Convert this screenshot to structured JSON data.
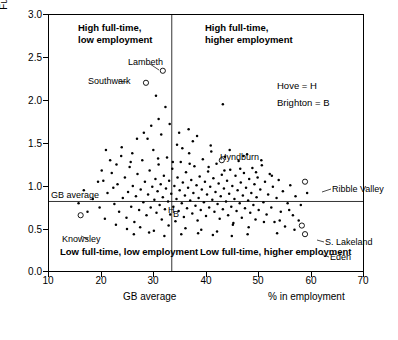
{
  "chart_data": {
    "type": "scatter",
    "title": "",
    "xlabel": "% in employment",
    "ylabel": "Full-time: part-time ratio",
    "xlim": [
      10,
      70
    ],
    "ylim": [
      0.0,
      3.0
    ],
    "xticks": [
      "10",
      "20",
      "30",
      "40",
      "50",
      "60",
      "70"
    ],
    "yticks": [
      "0.0",
      "0.5",
      "1.0",
      "1.5",
      "2.0",
      "2.5",
      "3.0"
    ],
    "grid": false,
    "legend_position": "upper right",
    "reference_lines": [
      {
        "name": "GB average vertical",
        "axis": "x",
        "value": 33.5,
        "label": "GB average"
      },
      {
        "name": "GB average horizontal",
        "axis": "y",
        "value": 0.82,
        "label": "GB average"
      }
    ],
    "quadrant_labels": [
      {
        "text": "High full-time,\nlow employment",
        "x": 21,
        "y": 2.9
      },
      {
        "text": "High full-time,\nhigher employment",
        "x": 40,
        "y": 2.9
      },
      {
        "text": "Low full-time, low employment",
        "x": 16,
        "y": 0.25
      },
      {
        "text": "Low full-time, higher employment",
        "x": 39,
        "y": 0.25
      }
    ],
    "key": [
      "Hove = H",
      "Brighton = B"
    ],
    "annotated_points": [
      {
        "label": "Lambeth",
        "x": 31.8,
        "y": 2.34
      },
      {
        "label": "Southwark",
        "x": 28.6,
        "y": 2.2
      },
      {
        "label": "Hyndburn",
        "x": 43.0,
        "y": 1.3
      },
      {
        "label": "Ribble Valley",
        "x": 58.8,
        "y": 1.05
      },
      {
        "label": "Knowsley",
        "x": 16.2,
        "y": 0.66
      },
      {
        "label": "S. Lakeland",
        "x": 58.2,
        "y": 0.54
      },
      {
        "label": "Eden",
        "x": 58.8,
        "y": 0.44
      },
      {
        "label": "H",
        "x": 33.4,
        "y": 0.72
      },
      {
        "label": "B",
        "x": 34.3,
        "y": 0.68
      }
    ],
    "points": [
      [
        20.5,
        1.06
      ],
      [
        21.3,
        0.92
      ],
      [
        22.1,
        1.15
      ],
      [
        22.6,
        0.79
      ],
      [
        23.2,
        1.02
      ],
      [
        23.5,
        0.7
      ],
      [
        23.9,
        1.35
      ],
      [
        24.2,
        0.86
      ],
      [
        24.6,
        1.1
      ],
      [
        24.9,
        0.63
      ],
      [
        25.2,
        0.93
      ],
      [
        25.5,
        1.22
      ],
      [
        25.8,
        0.76
      ],
      [
        26.1,
        1.0
      ],
      [
        26.4,
        0.58
      ],
      [
        26.7,
        0.88
      ],
      [
        27.0,
        1.14
      ],
      [
        27.3,
        0.72
      ],
      [
        27.6,
        0.96
      ],
      [
        27.9,
        1.3
      ],
      [
        28.1,
        0.81
      ],
      [
        28.4,
        1.05
      ],
      [
        28.7,
        0.66
      ],
      [
        29.0,
        0.9
      ],
      [
        29.3,
        1.18
      ],
      [
        29.5,
        0.75
      ],
      [
        29.8,
        0.99
      ],
      [
        30.0,
        1.42
      ],
      [
        30.2,
        0.84
      ],
      [
        30.4,
        1.08
      ],
      [
        30.6,
        0.69
      ],
      [
        30.8,
        0.94
      ],
      [
        31.0,
        1.25
      ],
      [
        31.2,
        0.78
      ],
      [
        31.4,
        1.02
      ],
      [
        31.6,
        0.61
      ],
      [
        31.8,
        0.87
      ],
      [
        32.0,
        1.12
      ],
      [
        32.2,
        0.73
      ],
      [
        32.4,
        0.97
      ],
      [
        32.6,
        1.33
      ],
      [
        32.8,
        0.82
      ],
      [
        33.0,
        1.06
      ],
      [
        33.2,
        0.67
      ],
      [
        33.4,
        0.91
      ],
      [
        33.6,
        1.2
      ],
      [
        33.8,
        0.76
      ],
      [
        34.0,
        1.0
      ],
      [
        34.2,
        0.59
      ],
      [
        34.4,
        0.85
      ],
      [
        34.6,
        1.1
      ],
      [
        34.8,
        0.71
      ],
      [
        35.0,
        0.95
      ],
      [
        35.2,
        1.28
      ],
      [
        35.4,
        0.8
      ],
      [
        35.6,
        1.04
      ],
      [
        35.8,
        0.64
      ],
      [
        36.0,
        0.89
      ],
      [
        36.2,
        1.16
      ],
      [
        36.4,
        0.74
      ],
      [
        36.6,
        0.98
      ],
      [
        36.8,
        1.38
      ],
      [
        37.0,
        0.83
      ],
      [
        37.2,
        1.07
      ],
      [
        37.4,
        0.68
      ],
      [
        37.6,
        0.92
      ],
      [
        37.8,
        1.23
      ],
      [
        38.0,
        0.77
      ],
      [
        38.2,
        1.01
      ],
      [
        38.4,
        0.6
      ],
      [
        38.6,
        0.86
      ],
      [
        38.8,
        1.11
      ],
      [
        39.0,
        0.72
      ],
      [
        39.2,
        0.96
      ],
      [
        39.4,
        1.31
      ],
      [
        39.6,
        0.81
      ],
      [
        39.8,
        1.05
      ],
      [
        40.0,
        0.65
      ],
      [
        40.2,
        0.9
      ],
      [
        40.4,
        1.17
      ],
      [
        40.6,
        0.75
      ],
      [
        40.8,
        0.99
      ],
      [
        41.0,
        1.4
      ],
      [
        41.2,
        0.84
      ],
      [
        41.4,
        1.09
      ],
      [
        41.6,
        0.7
      ],
      [
        41.8,
        0.93
      ],
      [
        42.0,
        1.26
      ],
      [
        42.2,
        0.79
      ],
      [
        42.4,
        1.03
      ],
      [
        42.6,
        0.62
      ],
      [
        42.8,
        0.88
      ],
      [
        43.0,
        1.13
      ],
      [
        43.2,
        0.73
      ],
      [
        43.4,
        0.97
      ],
      [
        43.6,
        1.34
      ],
      [
        43.8,
        0.82
      ],
      [
        44.0,
        1.06
      ],
      [
        44.2,
        0.66
      ],
      [
        44.4,
        0.91
      ],
      [
        44.6,
        1.19
      ],
      [
        44.8,
        0.76
      ],
      [
        45.0,
        1.0
      ],
      [
        45.2,
        0.57
      ],
      [
        45.4,
        0.85
      ],
      [
        45.6,
        1.12
      ],
      [
        45.8,
        0.71
      ],
      [
        46.0,
        0.95
      ],
      [
        46.2,
        1.29
      ],
      [
        46.4,
        0.8
      ],
      [
        46.6,
        1.04
      ],
      [
        46.8,
        0.63
      ],
      [
        47.0,
        0.89
      ],
      [
        47.2,
        1.15
      ],
      [
        47.4,
        0.74
      ],
      [
        47.6,
        0.98
      ],
      [
        47.8,
        1.37
      ],
      [
        48.0,
        0.83
      ],
      [
        48.2,
        1.08
      ],
      [
        48.4,
        0.69
      ],
      [
        48.6,
        0.92
      ],
      [
        48.8,
        1.21
      ],
      [
        49.0,
        0.78
      ],
      [
        49.2,
        1.02
      ],
      [
        49.4,
        0.61
      ],
      [
        49.6,
        0.87
      ],
      [
        49.8,
        1.1
      ],
      [
        50.0,
        0.72
      ],
      [
        50.3,
        0.96
      ],
      [
        50.6,
        1.24
      ],
      [
        50.9,
        0.81
      ],
      [
        51.2,
        1.05
      ],
      [
        51.5,
        0.67
      ],
      [
        51.8,
        0.9
      ],
      [
        52.1,
        1.14
      ],
      [
        52.4,
        0.75
      ],
      [
        52.7,
        0.99
      ],
      [
        53.0,
        0.58
      ],
      [
        53.4,
        0.86
      ],
      [
        53.8,
        1.07
      ],
      [
        54.2,
        0.7
      ],
      [
        54.6,
        0.94
      ],
      [
        55.0,
        0.53
      ],
      [
        55.5,
        0.8
      ],
      [
        56.0,
        1.01
      ],
      [
        56.5,
        0.66
      ],
      [
        57.0,
        0.88
      ],
      [
        19.8,
        0.75
      ],
      [
        20.8,
        0.62
      ],
      [
        21.8,
        1.3
      ],
      [
        22.9,
        0.55
      ],
      [
        24.0,
        1.45
      ],
      [
        25.0,
        0.5
      ],
      [
        26.0,
        1.38
      ],
      [
        27.5,
        0.52
      ],
      [
        28.9,
        1.55
      ],
      [
        30.1,
        0.48
      ],
      [
        31.5,
        1.6
      ],
      [
        32.9,
        0.54
      ],
      [
        34.5,
        1.48
      ],
      [
        36.1,
        0.51
      ],
      [
        37.5,
        1.52
      ],
      [
        39.1,
        0.49
      ],
      [
        40.5,
        1.22
      ],
      [
        42.1,
        0.47
      ],
      [
        43.5,
        1.18
      ],
      [
        45.1,
        0.55
      ],
      [
        46.5,
        1.2
      ],
      [
        48.1,
        0.52
      ],
      [
        49.5,
        1.16
      ],
      [
        51.0,
        0.58
      ],
      [
        52.5,
        1.12
      ],
      [
        54.0,
        0.6
      ],
      [
        55.8,
        0.72
      ],
      [
        30.5,
        2.05
      ],
      [
        31.0,
        1.78
      ],
      [
        33.1,
        1.72
      ],
      [
        29.6,
        1.7
      ],
      [
        32.3,
        1.92
      ],
      [
        34.9,
        1.62
      ],
      [
        36.7,
        1.66
      ],
      [
        38.3,
        1.58
      ],
      [
        28.2,
        1.62
      ],
      [
        26.9,
        1.55
      ],
      [
        35.5,
        1.44
      ],
      [
        40.9,
        1.47
      ],
      [
        44.5,
        1.42
      ],
      [
        47.1,
        1.35
      ],
      [
        50.5,
        1.3
      ],
      [
        23.0,
        1.25
      ],
      [
        21.0,
        1.42
      ],
      [
        19.5,
        1.05
      ],
      [
        18.5,
        0.85
      ],
      [
        17.5,
        0.7
      ],
      [
        16.8,
        0.95
      ],
      [
        15.8,
        0.8
      ],
      [
        53.5,
        0.45
      ],
      [
        56.8,
        0.49
      ],
      [
        57.6,
        0.6
      ],
      [
        58.0,
        0.78
      ],
      [
        59.2,
        0.92
      ],
      [
        44.9,
        0.42
      ],
      [
        47.9,
        0.44
      ],
      [
        41.3,
        0.43
      ],
      [
        38.5,
        0.45
      ],
      [
        35.3,
        0.44
      ],
      [
        32.1,
        0.42
      ],
      [
        29.2,
        0.46
      ],
      [
        26.3,
        0.44
      ],
      [
        43.2,
        1.95
      ],
      [
        30.9,
        1.32
      ],
      [
        33.7,
        1.28
      ],
      [
        36.9,
        1.26
      ],
      [
        25.7,
        1.28
      ],
      [
        22.4,
        0.98
      ],
      [
        20.2,
        1.18
      ]
    ]
  }
}
